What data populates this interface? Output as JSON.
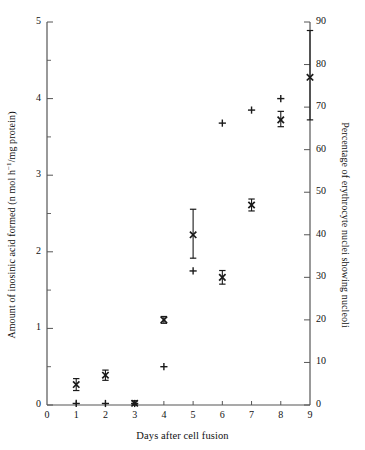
{
  "chart_data": {
    "type": "scatter",
    "title": "",
    "xlabel": "Days after cell fusion",
    "ylabel_left": "Amount of inosinic acid formed (n mol h⁻¹/mg protein)",
    "ylabel_right": "Percentage of erythrocyte nuclei showing nucleoli",
    "xlim": [
      0,
      9
    ],
    "ylim_left": [
      0,
      5
    ],
    "ylim_right": [
      0,
      90
    ],
    "xticks": [
      0,
      1,
      2,
      3,
      4,
      5,
      6,
      7,
      8,
      9
    ],
    "yticks_left": [
      0,
      1,
      2,
      3,
      4,
      5
    ],
    "yticks_left_minor": [
      0.5,
      1.5,
      2.5,
      3.5,
      4.5
    ],
    "yticks_right": [
      0,
      10,
      20,
      30,
      40,
      50,
      60,
      70,
      80,
      90
    ],
    "grid": false,
    "legend_position": "none",
    "series": [
      {
        "name": "Percentage of erythrocyte nuclei showing nucleoli",
        "marker": "x",
        "axis": "right",
        "x": [
          1,
          2,
          3,
          4,
          5,
          6,
          7,
          8
        ],
        "values": [
          4.8,
          7.0,
          0.4,
          20.0,
          40.0,
          30.0,
          47.0,
          67.0
        ],
        "err_low": [
          3.4,
          5.8,
          0.0,
          19.2,
          34.5,
          28.4,
          45.6,
          65.4
        ],
        "err_high": [
          6.2,
          8.2,
          1.0,
          20.8,
          46.0,
          31.6,
          48.4,
          69.0
        ]
      },
      {
        "name": "Amount of inosinic acid formed",
        "marker": "+",
        "axis": "left",
        "x": [
          1,
          2,
          3,
          4,
          5,
          6,
          7,
          8
        ],
        "values": [
          0.02,
          0.02,
          0.02,
          0.5,
          1.75,
          3.68,
          3.85,
          4.0
        ]
      },
      {
        "name": "Control nucleoli percentage at day 9",
        "marker": "x",
        "axis": "right",
        "x": [
          9
        ],
        "values": [
          77.0
        ],
        "err_low": [
          67.0
        ],
        "err_high": [
          88.0
        ]
      }
    ],
    "annotations": []
  },
  "axes": {
    "x_title": "Days after cell fusion",
    "y_left_title_pre": "Amount of inosinic acid formed (n mol h",
    "y_left_title_sup": "−1",
    "y_left_title_post": "/mg protein)",
    "y_right_title": "Percentage of erythrocyte nuclei showing nucleoli"
  },
  "colors": {
    "ink": "#1a1a1a",
    "axis": "#555555",
    "background": "#ffffff"
  }
}
